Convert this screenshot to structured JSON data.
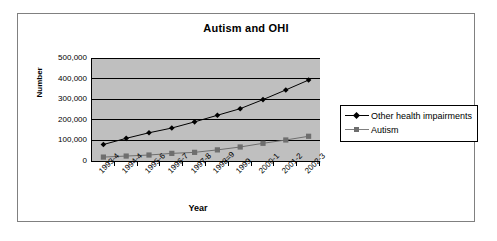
{
  "chart_data": {
    "type": "line",
    "title": "Autism and OHI",
    "xlabel": "Year",
    "ylabel": "Number",
    "categories": [
      "1993-4",
      "1994-4",
      "1995-6",
      "1996-7",
      "1997-8",
      "1998=9",
      "1999",
      "2000-1",
      "2001-2",
      "2002-3"
    ],
    "series": [
      {
        "name": "Other health impairments",
        "marker": "diamond",
        "color": "#000000",
        "values": [
          80000,
          110000,
          137000,
          160000,
          190000,
          222000,
          254000,
          298000,
          345000,
          393000
        ]
      },
      {
        "name": "Autism",
        "marker": "square",
        "color": "#6e6e6e",
        "values": [
          19000,
          24000,
          29000,
          37000,
          42000,
          54000,
          68000,
          86000,
          102000,
          120000
        ]
      }
    ],
    "ylim": [
      0,
      500000
    ],
    "yticks": [
      0,
      100000,
      200000,
      300000,
      400000,
      500000
    ],
    "ytick_labels": [
      "0",
      "100,000",
      "200,000",
      "300,000",
      "400,000",
      "500,000"
    ],
    "grid": "horizontal",
    "legend_position": "right",
    "plot_background": "#bfbfbf"
  },
  "legend": {
    "entries": [
      {
        "label": "Other health impairments"
      },
      {
        "label": "Autism"
      }
    ]
  }
}
